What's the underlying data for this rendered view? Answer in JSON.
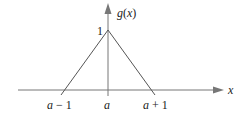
{
  "diagram": {
    "y_axis_label": "g(x)",
    "x_axis_label": "x",
    "peak_value_label": "1",
    "x_tick_labels": [
      "a − 1",
      "a",
      "a + 1"
    ],
    "line_color": "#555555",
    "axis_color": "#666666"
  }
}
